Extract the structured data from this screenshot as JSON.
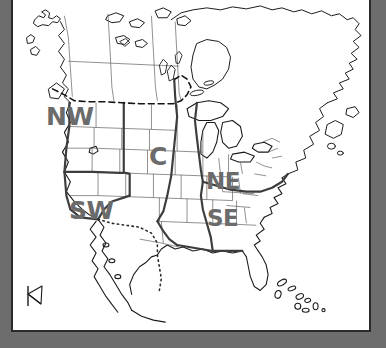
{
  "window": {
    "background_color": "#6d6d6d",
    "canvas_color": "#ffffff",
    "frame_color": "#2b2b2b"
  },
  "map": {
    "title": "North America regional map",
    "label_color": "#6b6b6b",
    "coastline_color": "#1a1a1a",
    "state_border_color": "#555555",
    "region_border_color": "#3a3a3a",
    "international_border_style": "dashed",
    "mexico_border_style": "dotted",
    "regions": [
      {
        "code": "NW",
        "name": "Northwest"
      },
      {
        "code": "SW",
        "name": "Southwest"
      },
      {
        "code": "C",
        "name": "Central"
      },
      {
        "code": "NE",
        "name": "Northeast"
      },
      {
        "code": "SE",
        "name": "Southeast"
      }
    ]
  },
  "resize_handle": {
    "name": "resize-corner",
    "position": "bottom-left"
  }
}
